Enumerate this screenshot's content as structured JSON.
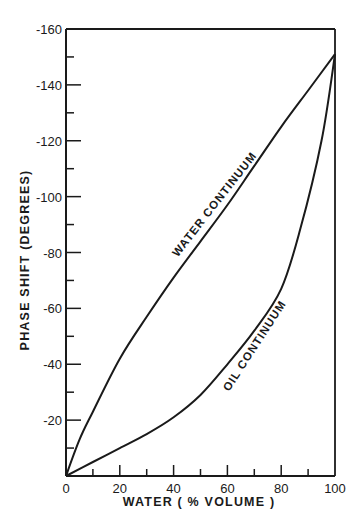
{
  "chart_data": {
    "type": "line",
    "title": "",
    "xlabel": "WATER ( % VOLUME )",
    "ylabel": "PHASE SHIFT (DEGREES)",
    "xlim": [
      0,
      100
    ],
    "ylim": [
      0,
      -160
    ],
    "x_ticks": [
      0,
      20,
      40,
      60,
      80,
      100
    ],
    "x_tick_labels": [
      "0",
      "20",
      "40",
      "60",
      "80",
      "100"
    ],
    "y_ticks": [
      -20,
      -40,
      -60,
      -80,
      -100,
      -120,
      -140,
      -160
    ],
    "y_tick_labels": [
      "-20",
      "-40",
      "-60",
      "-80",
      "-100",
      "-120",
      "-140",
      "-160"
    ],
    "grid": false,
    "legend": "none (inline curve labels)",
    "series": [
      {
        "name": "WATER CONTINUUM",
        "x": [
          0,
          5,
          10,
          20,
          30,
          40,
          50,
          60,
          70,
          80,
          90,
          100
        ],
        "y": [
          0,
          -13,
          -23,
          -42,
          -57,
          -71,
          -84,
          -97,
          -111,
          -125,
          -138,
          -151
        ]
      },
      {
        "name": "OIL CONTINUUM",
        "x": [
          0,
          10,
          20,
          30,
          40,
          50,
          60,
          70,
          80,
          87,
          95,
          100
        ],
        "y": [
          0,
          -5,
          -10,
          -15,
          -21,
          -29,
          -40,
          -52,
          -67,
          -88,
          -120,
          -151
        ]
      }
    ],
    "annotations": [
      {
        "text": "WATER CONTINUUM",
        "x": 60,
        "y": -95,
        "rotation": -52
      },
      {
        "text": "OIL CONTINUUM",
        "x": 75,
        "y": -48,
        "rotation": -57
      }
    ]
  }
}
